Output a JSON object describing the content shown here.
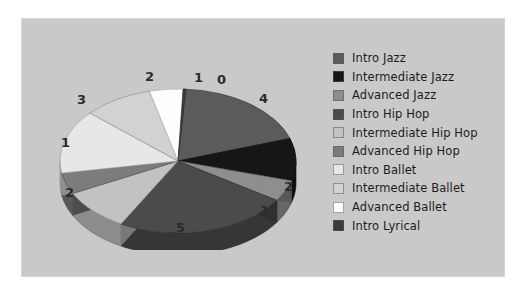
{
  "panel": {
    "background": "#c9c9c9"
  },
  "chart_data": {
    "type": "pie",
    "title": "",
    "subtitle": "",
    "xlabel": "",
    "ylabel": "",
    "three_d": true,
    "legend_position": "right",
    "grid": false,
    "categories": [
      "Intro Jazz",
      "Intermediate Jazz",
      "Advanced Jazz",
      "Intro Hip Hop",
      "Intermediate Hip Hop",
      "Advanced Hip Hop",
      "Intro Ballet",
      "Intermediate Ballet",
      "Advanced Ballet",
      "Intro Lyrical"
    ],
    "values": [
      4,
      2,
      1,
      5,
      2,
      1,
      3,
      2,
      1,
      0
    ],
    "data_labels": [
      "4",
      "2",
      "1",
      "5",
      "2",
      "1",
      "3",
      "2",
      "1",
      "0"
    ],
    "colors": [
      "#5b5b5b",
      "#161616",
      "#8e8e8e",
      "#4b4b4b",
      "#c2c2c2",
      "#7c7c7c",
      "#e7e7e7",
      "#d2d2d2",
      "#fdfdfd",
      "#3b3b3b"
    ],
    "total": 21
  },
  "legend": {
    "items": [
      {
        "label": "Intro Jazz",
        "color": "#5b5b5b"
      },
      {
        "label": "Intermediate Jazz",
        "color": "#161616"
      },
      {
        "label": "Advanced Jazz",
        "color": "#8e8e8e"
      },
      {
        "label": "Intro Hip Hop",
        "color": "#4b4b4b"
      },
      {
        "label": "Intermediate Hip Hop",
        "color": "#c2c2c2"
      },
      {
        "label": "Advanced Hip Hop",
        "color": "#7c7c7c"
      },
      {
        "label": "Intro Ballet",
        "color": "#e7e7e7"
      },
      {
        "label": "Intermediate Ballet",
        "color": "#d2d2d2"
      },
      {
        "label": "Advanced Ballet",
        "color": "#fdfdfd"
      },
      {
        "label": "Intro Lyrical",
        "color": "#3b3b3b"
      }
    ]
  },
  "data_labels": [
    {
      "text": "0",
      "x": 196,
      "y": 55
    },
    {
      "text": "4",
      "x": 238,
      "y": 74
    },
    {
      "text": "2",
      "x": 263,
      "y": 162
    },
    {
      "text": "1",
      "x": 239,
      "y": 186
    },
    {
      "text": "5",
      "x": 155,
      "y": 203
    },
    {
      "text": "2",
      "x": 44,
      "y": 168
    },
    {
      "text": "1",
      "x": 40,
      "y": 118
    },
    {
      "text": "3",
      "x": 56,
      "y": 75
    },
    {
      "text": "2",
      "x": 124,
      "y": 52
    },
    {
      "text": "1",
      "x": 173,
      "y": 53
    }
  ]
}
